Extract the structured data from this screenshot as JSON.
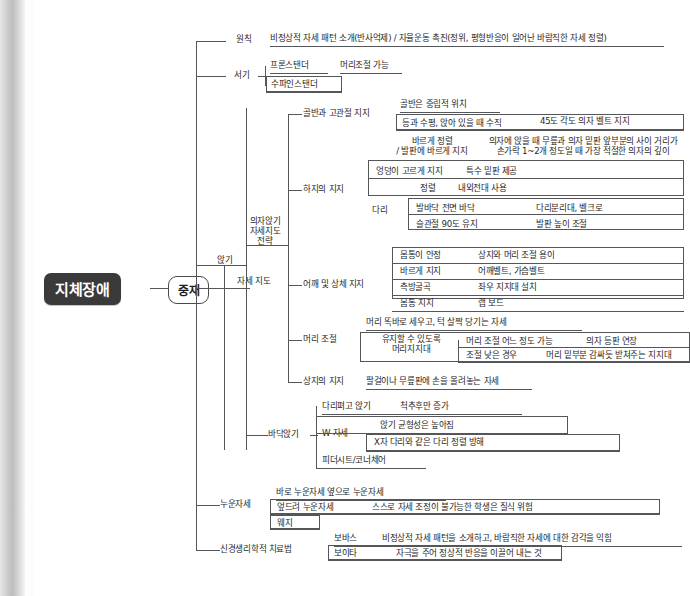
{
  "diagram": {
    "type": "tree-mindmap",
    "language": "ko",
    "root": "지체장애",
    "root_child": "중재"
  },
  "branches": {
    "posture_guidance": "자세 지도",
    "sitting": "앉기",
    "chair_sitting_strategy": "의자앉기 자세지도 전략"
  },
  "principle": {
    "label": "원칙",
    "text": "비정상적 자세 패턴 소개(반사억제) / 자율운동 촉진(정위, 평형반응이 일어난 바람직한 자세 정렬)"
  },
  "standing": {
    "label": "서기",
    "items": [
      {
        "name": "프론스탠더",
        "detail": "머리조절 가능"
      },
      {
        "name": "수파인스탠더",
        "detail": ""
      }
    ]
  },
  "pelvis": {
    "label": "골반과 고관절 지지",
    "rows": [
      {
        "left": "골반은 중립적 위치",
        "right": ""
      },
      {
        "left": "등과 수평, 앉아 있을 때 수직",
        "right": "45도 각도 의자 벨트 지지"
      },
      {
        "left": "바르게 정렬\n/ 발판에 바르게 지지",
        "right": "의자에 앉을 때 무릎과 의자 밑판 앞부분의 사이 거리가\n손가락 1~2개 정도일 때 가장 적절한 의자의 깊이"
      }
    ]
  },
  "lower_limb": {
    "label": "하지의 지지",
    "rows": [
      {
        "left": "엉덩이 고르게 지지",
        "right": "특수 밑판 제공"
      },
      {
        "left": "정렬",
        "right": "내외전대 사용"
      }
    ],
    "leg_label": "다리",
    "leg_rows": [
      {
        "left": "발바닥 전면 바닥",
        "right": "다리분리대, 벨크로"
      },
      {
        "left": "슬관절 90도 유지",
        "right": "발판 높이 조절"
      }
    ]
  },
  "shoulder": {
    "label": "어깨 및 상체 지지",
    "rows": [
      {
        "left": "몸통이 안정",
        "right": "상지와 머리 조절 용이"
      },
      {
        "left": "바르게 지지",
        "right": "어깨벨트, 가슴벨트"
      },
      {
        "left": "측방굴곡",
        "right": "좌우 지지대 설치"
      },
      {
        "left": "몸통 지지",
        "right": "랩 보드"
      }
    ]
  },
  "head": {
    "label": "머리 조절",
    "top_text": "머리 똑바로 세우고, 턱 살짝 당기는 자세",
    "support": "유지할 수 있도록\n머리지지대",
    "rows": [
      {
        "left": "머리 조절 어느 정도 가능",
        "right": "의자 등판 연장"
      },
      {
        "left": "조절 낮은 경우",
        "right": "머리 밑부분 감싸듯 받쳐주는 지지대"
      }
    ]
  },
  "upper_limb": {
    "label": "상지의 지지",
    "detail": "팔걸이나 무릎판에 손을 올려놓는 자세"
  },
  "floor_sitting": {
    "label": "바닥앉기",
    "rows": [
      {
        "left": "다리펴고 앉기",
        "right": "척추후만 증가"
      }
    ],
    "w_label": "W 자세",
    "w_rows": [
      "앉기 균형성은 높아짐",
      "X자 다리와 같은 다리 정렬 방해"
    ],
    "last": "피더시트/코너체어"
  },
  "lying": {
    "label": "누운자세",
    "top_text": "바로 누운자세 옆으로 누운자세",
    "rows": [
      {
        "left": "엎드려 누운자세",
        "right": "스스로 자세 조정이 불가능한 학생은 질식 위험"
      },
      {
        "left": "웨지",
        "right": ""
      }
    ]
  },
  "neurophysiology": {
    "label": "신경생리학적 치료법",
    "rows": [
      {
        "left": "보바스",
        "right": "비정상적 자세 패턴을 소개하고, 바람직한 자세에 대한 감각을 익힘"
      },
      {
        "left": "보이타",
        "right": "자극을 주어 정상적 반응을 이끌어 내는 것"
      }
    ]
  },
  "colors": {
    "root_bg": "#3a3a3a",
    "root_text": "#ffffff",
    "line": "#55565a",
    "text": "#1d1d1d",
    "page_bg": "#ffffff"
  }
}
